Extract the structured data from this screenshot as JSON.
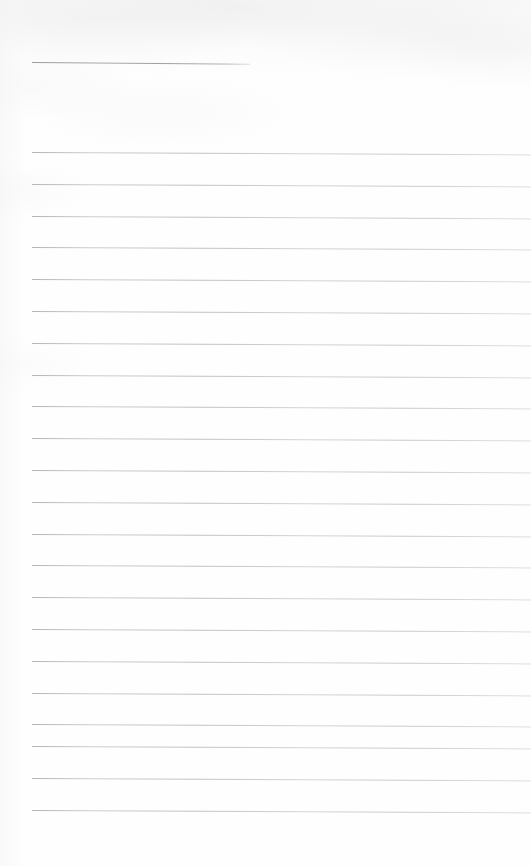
{
  "page": {
    "name": "blank-lined-notepad-page",
    "width": 531,
    "height": 866,
    "background_color": "#fefefe",
    "paper_tone": "off-white",
    "content_text": "",
    "is_blank": true
  },
  "heading_rule": {
    "label": "",
    "x_start": 32,
    "x_end": 250,
    "y": 62,
    "slope_deg": 0.45,
    "color": "#9a9a9a",
    "thickness": 1
  },
  "ruling": {
    "line_color": "#c2c2c2",
    "line_thickness": 1,
    "x_start": 32,
    "x_end": 531,
    "first_line_y": 152,
    "spacing": 31.8,
    "slope_deg": 0.28,
    "count": 22,
    "lines": [
      {
        "index": 1,
        "y": 152,
        "text": ""
      },
      {
        "index": 2,
        "y": 184,
        "text": ""
      },
      {
        "index": 3,
        "y": 216,
        "text": ""
      },
      {
        "index": 4,
        "y": 247,
        "text": ""
      },
      {
        "index": 5,
        "y": 279,
        "text": ""
      },
      {
        "index": 6,
        "y": 311,
        "text": ""
      },
      {
        "index": 7,
        "y": 343,
        "text": ""
      },
      {
        "index": 8,
        "y": 375,
        "text": ""
      },
      {
        "index": 9,
        "y": 406,
        "text": ""
      },
      {
        "index": 10,
        "y": 438,
        "text": ""
      },
      {
        "index": 11,
        "y": 470,
        "text": ""
      },
      {
        "index": 12,
        "y": 502,
        "text": ""
      },
      {
        "index": 13,
        "y": 534,
        "text": ""
      },
      {
        "index": 14,
        "y": 565,
        "text": ""
      },
      {
        "index": 15,
        "y": 597,
        "text": ""
      },
      {
        "index": 16,
        "y": 629,
        "text": ""
      },
      {
        "index": 17,
        "y": 661,
        "text": ""
      },
      {
        "index": 18,
        "y": 693,
        "text": ""
      },
      {
        "index": 19,
        "y": 724,
        "text": ""
      },
      {
        "index": 20,
        "y": 746,
        "text": ""
      },
      {
        "index": 21,
        "y": 778,
        "text": ""
      },
      {
        "index": 22,
        "y": 810,
        "text": ""
      }
    ]
  },
  "margins": {
    "left_margin_px": 32,
    "top_margin_px": 62,
    "bottom_blank_px": 56
  }
}
